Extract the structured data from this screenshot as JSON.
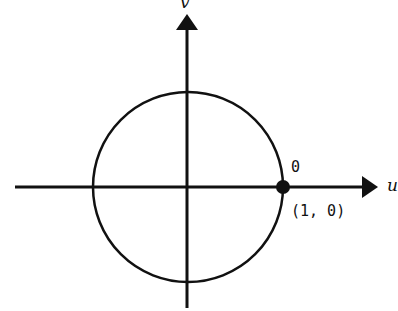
{
  "diagram": {
    "type": "unit-circle-plane",
    "axes": {
      "horizontal_label": "u",
      "vertical_label": "v"
    },
    "circle": {
      "description": "unit circle centered at origin"
    },
    "point": {
      "angle_label": "0",
      "coordinate_label": "(1, 0)"
    },
    "colors": {
      "stroke": "#111111",
      "background": "#ffffff"
    }
  }
}
